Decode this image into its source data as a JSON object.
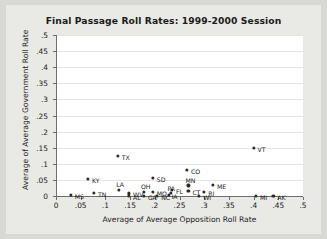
{
  "chart_data": {
    "type": "scatter",
    "title": "Final Passage Roll Rates: 1999-2000 Session",
    "xlabel": "Average of Average Opposition Roll Rate",
    "ylabel": "Average of Average Government Roll Rate",
    "xlim": [
      0,
      0.5
    ],
    "ylim": [
      0,
      0.5
    ],
    "xticks": [
      "0",
      ".05",
      ".1",
      ".15",
      ".2",
      ".25",
      ".3",
      ".35",
      ".4",
      ".45",
      ".5"
    ],
    "xtick_values": [
      0,
      0.05,
      0.1,
      0.15,
      0.2,
      0.25,
      0.3,
      0.35,
      0.4,
      0.45,
      0.5
    ],
    "yticks": [
      "0",
      ".05",
      ".1",
      ".15",
      ".2",
      ".25",
      ".3",
      ".35",
      ".4",
      ".45",
      ".5"
    ],
    "ytick_values": [
      0,
      0.05,
      0.1,
      0.15,
      0.2,
      0.25,
      0.3,
      0.35,
      0.4,
      0.45,
      0.5
    ],
    "grid": "horizontal",
    "legend": "none",
    "marker_color": "#2b2b2b",
    "plot_background": "#ffffff",
    "figure_background": "#e9e9e6",
    "points": [
      {
        "label": "MS",
        "x": 0.03,
        "y": 0.003,
        "lx": 4,
        "ly": -2
      },
      {
        "label": "KY",
        "x": 0.065,
        "y": 0.052,
        "lx": 4,
        "ly": -2
      },
      {
        "label": "TN",
        "x": 0.077,
        "y": 0.009,
        "lx": 4,
        "ly": -2
      },
      {
        "label": "TX",
        "x": 0.125,
        "y": 0.125,
        "lx": 4,
        "ly": -2
      },
      {
        "label": "LA",
        "x": 0.128,
        "y": 0.018,
        "lx": -3,
        "ly": -9
      },
      {
        "label": "WV",
        "x": 0.148,
        "y": 0.008,
        "lx": 4,
        "ly": -2
      },
      {
        "label": "AL",
        "x": 0.148,
        "y": 0.0,
        "lx": 4,
        "ly": -2
      },
      {
        "label": "OH",
        "x": 0.178,
        "y": 0.012,
        "lx": -3,
        "ly": -9
      },
      {
        "label": "GA",
        "x": 0.178,
        "y": 0.0,
        "lx": 4,
        "ly": -2
      },
      {
        "label": "MO",
        "x": 0.196,
        "y": 0.013,
        "lx": 4,
        "ly": -2
      },
      {
        "label": "SD",
        "x": 0.196,
        "y": 0.056,
        "lx": 4,
        "ly": -2
      },
      {
        "label": "NC",
        "x": 0.205,
        "y": 0.0,
        "lx": 4,
        "ly": -2
      },
      {
        "label": "IA",
        "x": 0.228,
        "y": 0.003,
        "lx": 3,
        "ly": -2
      },
      {
        "label": "PA",
        "x": 0.232,
        "y": 0.01,
        "lx": -3,
        "ly": -8
      },
      {
        "label": "FL",
        "x": 0.235,
        "y": 0.018,
        "lx": 4,
        "ly": -2
      },
      {
        "label": "CO",
        "x": 0.265,
        "y": 0.08,
        "lx": 4,
        "ly": -2
      },
      {
        "label": "CT",
        "x": 0.268,
        "y": 0.015,
        "lx": 4,
        "ly": -2
      },
      {
        "label": "MN",
        "x": 0.268,
        "y": 0.033,
        "lx": -3,
        "ly": -8
      },
      {
        "label": "WI",
        "x": 0.29,
        "y": 0.0,
        "lx": 4,
        "ly": -2
      },
      {
        "label": "ME",
        "x": 0.318,
        "y": 0.035,
        "lx": 4,
        "ly": -2
      },
      {
        "label": "RI",
        "x": 0.3,
        "y": 0.012,
        "lx": 4,
        "ly": -2
      },
      {
        "label": "VT",
        "x": 0.4,
        "y": 0.15,
        "lx": 4,
        "ly": -2
      },
      {
        "label": "MI",
        "x": 0.405,
        "y": 0.0,
        "lx": 4,
        "ly": -2
      },
      {
        "label": "AK",
        "x": 0.44,
        "y": 0.0,
        "lx": 4,
        "ly": -2
      }
    ]
  }
}
